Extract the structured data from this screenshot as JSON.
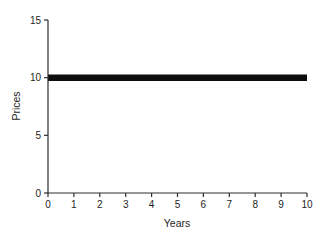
{
  "chart": {
    "background": "#ffffff",
    "axis_color": "#2e2e2e",
    "text_color": "#1e1e1e",
    "line_color": "#0d0d0d"
  },
  "chart_data": {
    "type": "line",
    "title": "",
    "xlabel": "Years",
    "ylabel": "Prices",
    "xlim": [
      0,
      10
    ],
    "ylim": [
      0,
      15
    ],
    "xticks": [
      0,
      1,
      2,
      3,
      4,
      5,
      6,
      7,
      8,
      9,
      10
    ],
    "yticks": [
      0,
      5,
      10,
      15
    ],
    "grid": false,
    "legend": "none",
    "series": [
      {
        "name": "Prices",
        "x": [
          0,
          10
        ],
        "y": [
          10,
          10
        ],
        "color": "#0d0d0d",
        "line_width_px": 6.5
      }
    ]
  }
}
